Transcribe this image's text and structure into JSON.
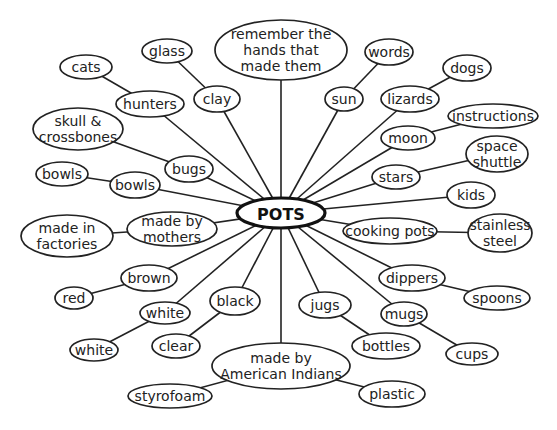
{
  "diagram": {
    "type": "concept-web",
    "center": {
      "id": "pots",
      "label": "POTS",
      "x": 281,
      "y": 213,
      "rx": 44,
      "ry": 15
    },
    "nodes": [
      {
        "id": "remember",
        "lines": [
          "remember the",
          "hands that",
          "made them"
        ],
        "x": 281,
        "y": 50,
        "rx": 66,
        "ry": 30,
        "parent": "pots"
      },
      {
        "id": "clay",
        "lines": [
          "clay"
        ],
        "x": 217,
        "y": 99,
        "rx": 23,
        "ry": 13,
        "parent": "pots"
      },
      {
        "id": "glass",
        "lines": [
          "glass"
        ],
        "x": 167,
        "y": 51,
        "rx": 25,
        "ry": 12,
        "parent": "clay"
      },
      {
        "id": "hunters",
        "lines": [
          "hunters"
        ],
        "x": 150,
        "y": 104,
        "rx": 34,
        "ry": 13,
        "parent": "pots"
      },
      {
        "id": "cats",
        "lines": [
          "cats"
        ],
        "x": 86,
        "y": 67,
        "rx": 26,
        "ry": 12,
        "parent": "hunters"
      },
      {
        "id": "bugs",
        "lines": [
          "bugs"
        ],
        "x": 189,
        "y": 169,
        "rx": 24,
        "ry": 13,
        "parent": "pots"
      },
      {
        "id": "skull-crossbones",
        "lines": [
          "skull &",
          "crossbones"
        ],
        "x": 78,
        "y": 129,
        "rx": 45,
        "ry": 21,
        "parent": "bugs"
      },
      {
        "id": "bowls-inner",
        "lines": [
          "bowls"
        ],
        "x": 135,
        "y": 185,
        "rx": 25,
        "ry": 13,
        "parent": "pots"
      },
      {
        "id": "bowls-outer",
        "lines": [
          "bowls"
        ],
        "x": 62,
        "y": 174,
        "rx": 26,
        "ry": 12,
        "parent": "bowls-inner"
      },
      {
        "id": "made-by-mothers",
        "lines": [
          "made by",
          "mothers"
        ],
        "x": 172,
        "y": 229,
        "rx": 45,
        "ry": 17,
        "parent": "pots"
      },
      {
        "id": "made-in-factories",
        "lines": [
          "made in",
          "factories"
        ],
        "x": 67,
        "y": 236,
        "rx": 46,
        "ry": 21,
        "parent": "made-by-mothers"
      },
      {
        "id": "brown",
        "lines": [
          "brown"
        ],
        "x": 149,
        "y": 278,
        "rx": 28,
        "ry": 13,
        "parent": "pots"
      },
      {
        "id": "red",
        "lines": [
          "red"
        ],
        "x": 74,
        "y": 298,
        "rx": 19,
        "ry": 11,
        "parent": "brown"
      },
      {
        "id": "white-inner",
        "lines": [
          "white"
        ],
        "x": 165,
        "y": 313,
        "rx": 25,
        "ry": 11,
        "parent": "pots"
      },
      {
        "id": "white-outer",
        "lines": [
          "white"
        ],
        "x": 94,
        "y": 350,
        "rx": 24,
        "ry": 11,
        "parent": "white-inner"
      },
      {
        "id": "black",
        "lines": [
          "black"
        ],
        "x": 235,
        "y": 301,
        "rx": 25,
        "ry": 14,
        "parent": "pots"
      },
      {
        "id": "clear",
        "lines": [
          "clear"
        ],
        "x": 176,
        "y": 346,
        "rx": 24,
        "ry": 12,
        "parent": "black"
      },
      {
        "id": "made-by-american-indians",
        "lines": [
          "made by",
          "American Indians"
        ],
        "x": 281,
        "y": 366,
        "rx": 69,
        "ry": 23,
        "parent": "pots"
      },
      {
        "id": "styrofoam",
        "lines": [
          "styrofoam"
        ],
        "x": 170,
        "y": 396,
        "rx": 42,
        "ry": 12,
        "parent": "made-by-american-indians"
      },
      {
        "id": "plastic",
        "lines": [
          "plastic"
        ],
        "x": 392,
        "y": 394,
        "rx": 33,
        "ry": 13,
        "parent": "made-by-american-indians"
      },
      {
        "id": "jugs",
        "lines": [
          "jugs"
        ],
        "x": 325,
        "y": 305,
        "rx": 26,
        "ry": 13,
        "parent": "pots"
      },
      {
        "id": "bottles",
        "lines": [
          "bottles"
        ],
        "x": 386,
        "y": 346,
        "rx": 34,
        "ry": 13,
        "parent": "jugs"
      },
      {
        "id": "mugs",
        "lines": [
          "mugs"
        ],
        "x": 404,
        "y": 314,
        "rx": 23,
        "ry": 12,
        "parent": "pots"
      },
      {
        "id": "cups",
        "lines": [
          "cups"
        ],
        "x": 472,
        "y": 354,
        "rx": 26,
        "ry": 11,
        "parent": "mugs"
      },
      {
        "id": "dippers",
        "lines": [
          "dippers"
        ],
        "x": 412,
        "y": 278,
        "rx": 33,
        "ry": 13,
        "parent": "pots"
      },
      {
        "id": "spoons",
        "lines": [
          "spoons"
        ],
        "x": 497,
        "y": 298,
        "rx": 33,
        "ry": 12,
        "parent": "dippers"
      },
      {
        "id": "cooking-pots",
        "lines": [
          "cooking pots"
        ],
        "x": 390,
        "y": 231,
        "rx": 47,
        "ry": 13,
        "parent": "pots"
      },
      {
        "id": "stainless-steel",
        "lines": [
          "stainless",
          "steel"
        ],
        "x": 500,
        "y": 233,
        "rx": 32,
        "ry": 19,
        "parent": "cooking-pots"
      },
      {
        "id": "kids",
        "lines": [
          "kids"
        ],
        "x": 471,
        "y": 195,
        "rx": 24,
        "ry": 13,
        "parent": "pots"
      },
      {
        "id": "stars",
        "lines": [
          "stars"
        ],
        "x": 396,
        "y": 177,
        "rx": 24,
        "ry": 12,
        "parent": "pots"
      },
      {
        "id": "space-shuttle",
        "lines": [
          "space",
          "shuttle"
        ],
        "x": 497,
        "y": 154,
        "rx": 31,
        "ry": 18,
        "parent": "stars"
      },
      {
        "id": "moon",
        "lines": [
          "moon"
        ],
        "x": 408,
        "y": 138,
        "rx": 27,
        "ry": 12,
        "parent": "pots"
      },
      {
        "id": "instructions",
        "lines": [
          "instructions"
        ],
        "x": 493,
        "y": 116,
        "rx": 45,
        "ry": 12,
        "parent": "moon"
      },
      {
        "id": "lizards",
        "lines": [
          "lizards"
        ],
        "x": 410,
        "y": 99,
        "rx": 29,
        "ry": 13,
        "parent": "pots"
      },
      {
        "id": "dogs",
        "lines": [
          "dogs"
        ],
        "x": 467,
        "y": 68,
        "rx": 24,
        "ry": 13,
        "parent": "lizards"
      },
      {
        "id": "sun",
        "lines": [
          "sun"
        ],
        "x": 344,
        "y": 99,
        "rx": 19,
        "ry": 12,
        "parent": "pots"
      },
      {
        "id": "words",
        "lines": [
          "words"
        ],
        "x": 389,
        "y": 52,
        "rx": 24,
        "ry": 13,
        "parent": "sun"
      }
    ]
  }
}
